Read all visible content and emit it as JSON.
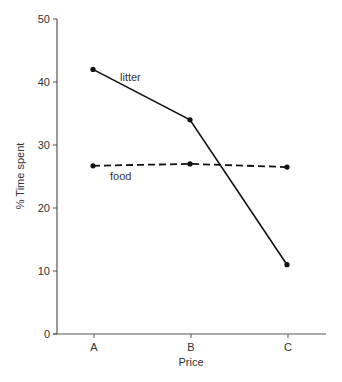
{
  "chart_data": {
    "type": "line",
    "title": "",
    "xlabel": "Price",
    "ylabel": "% Time spent",
    "categories": [
      "A",
      "B",
      "C"
    ],
    "yticks": [
      0,
      10,
      20,
      30,
      40,
      50
    ],
    "ylim": [
      0,
      50
    ],
    "grid": false,
    "legend": "inline labels",
    "series": [
      {
        "name": "litter",
        "style": "solid",
        "values": [
          42,
          34,
          11
        ]
      },
      {
        "name": "food",
        "style": "dashed",
        "values": [
          26.7,
          27,
          26.5
        ]
      }
    ],
    "colors": {
      "line": "#111111",
      "axis": "#555555",
      "text": "#333333"
    }
  }
}
